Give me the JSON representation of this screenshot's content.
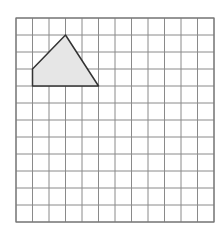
{
  "grid": {
    "columns": 12,
    "rows": 12,
    "origin_x": 16,
    "origin_y": 18,
    "cell_width": 16.5,
    "cell_height": 17,
    "line_color": "#8a8a8a",
    "border_color": "#777777"
  },
  "shape": {
    "type": "polygon",
    "vertices_grid": [
      [
        1,
        3
      ],
      [
        3,
        1
      ],
      [
        5,
        4
      ],
      [
        1,
        4
      ]
    ],
    "fill_color": "#e6e6e6",
    "stroke_color": "#333333"
  }
}
